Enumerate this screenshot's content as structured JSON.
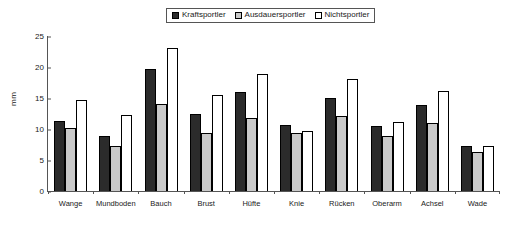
{
  "chart_data": {
    "type": "bar",
    "title": "",
    "xlabel": "",
    "ylabel": "mm",
    "ylim": [
      0,
      25
    ],
    "yticks": [
      0,
      5,
      10,
      15,
      20,
      25
    ],
    "grid": false,
    "legend_position": "top-center",
    "categories": [
      "Wange",
      "Mundboden",
      "Bauch",
      "Brust",
      "Hüfte",
      "Knie",
      "Rücken",
      "Oberarm",
      "Achsel",
      "Wade"
    ],
    "series": [
      {
        "name": "Kraftsportler",
        "color": "#2b2b2b",
        "values": [
          11.3,
          8.9,
          19.6,
          12.4,
          15.9,
          10.7,
          15.0,
          10.5,
          13.9,
          7.2
        ]
      },
      {
        "name": "Ausdauersportler",
        "color": "#c9c9c9",
        "values": [
          10.1,
          7.3,
          14.0,
          9.4,
          11.7,
          9.3,
          12.1,
          8.9,
          10.9,
          6.3
        ]
      },
      {
        "name": "Nichtsportler",
        "color": "#ffffff",
        "values": [
          14.6,
          12.2,
          23.0,
          15.5,
          18.9,
          9.7,
          18.0,
          11.2,
          16.1,
          7.2
        ]
      }
    ]
  }
}
